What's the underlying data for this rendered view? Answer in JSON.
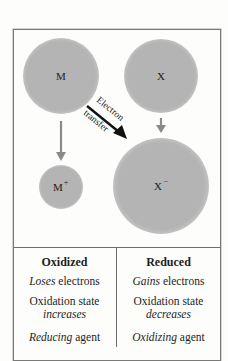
{
  "diagram": {
    "atoms": [
      {
        "id": "M",
        "label": "M",
        "sup": "",
        "cx": 61,
        "cy": 76,
        "r": 38
      },
      {
        "id": "X",
        "label": "X",
        "sup": "",
        "cx": 161,
        "cy": 76,
        "r": 37
      },
      {
        "id": "M_plus",
        "label": "M",
        "sup": "+",
        "cx": 61,
        "cy": 187,
        "r": 22
      },
      {
        "id": "X_minus",
        "label": "X",
        "sup": "−",
        "cx": 161,
        "cy": 186,
        "r": 48
      }
    ],
    "arrow_label_top": "Electron",
    "arrow_label_bottom": "transfer",
    "colors": {
      "atom_fill": "#b4b4b4",
      "gray_arrow": "#8a8a8a",
      "transfer_arrow": "#111111",
      "frame": "#7a7a7a"
    }
  },
  "table": {
    "oxidized": {
      "header": "Oxidized",
      "row1_em": "Loses",
      "row1_rest": " electrons",
      "row2_line1": "Oxidation state",
      "row2_line2_em": "increases",
      "row3_em": "Reducing",
      "row3_rest": " agent"
    },
    "reduced": {
      "header": "Reduced",
      "row1_em": "Gains",
      "row1_rest": " electrons",
      "row2_line1": "Oxidation state",
      "row2_line2_em": "decreases",
      "row3_em": "Oxidizing",
      "row3_rest": " agent"
    }
  }
}
